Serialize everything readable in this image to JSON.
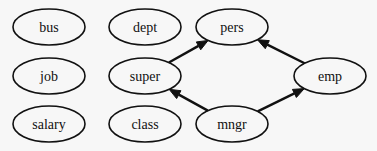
{
  "diagram": {
    "type": "directed-graph",
    "nodes": [
      {
        "id": "bus",
        "label": "bus",
        "cx": 49,
        "cy": 27,
        "rx": 36,
        "ry": 18
      },
      {
        "id": "job",
        "label": "job",
        "cx": 49,
        "cy": 76,
        "rx": 36,
        "ry": 18
      },
      {
        "id": "salary",
        "label": "salary",
        "cx": 49,
        "cy": 124,
        "rx": 36,
        "ry": 18
      },
      {
        "id": "dept",
        "label": "dept",
        "cx": 145,
        "cy": 27,
        "rx": 36,
        "ry": 18
      },
      {
        "id": "super",
        "label": "super",
        "cx": 145,
        "cy": 76,
        "rx": 36,
        "ry": 18
      },
      {
        "id": "class",
        "label": "class",
        "cx": 145,
        "cy": 124,
        "rx": 36,
        "ry": 18
      },
      {
        "id": "pers",
        "label": "pers",
        "cx": 232,
        "cy": 27,
        "rx": 36,
        "ry": 18
      },
      {
        "id": "emp",
        "label": "emp",
        "cx": 330,
        "cy": 76,
        "rx": 36,
        "ry": 18
      },
      {
        "id": "mngr",
        "label": "mngr",
        "cx": 232,
        "cy": 124,
        "rx": 36,
        "ry": 18
      }
    ],
    "edges": [
      {
        "from": "super",
        "to": "pers"
      },
      {
        "from": "mngr",
        "to": "super"
      },
      {
        "from": "mngr",
        "to": "emp"
      },
      {
        "from": "emp",
        "to": "pers"
      }
    ]
  }
}
